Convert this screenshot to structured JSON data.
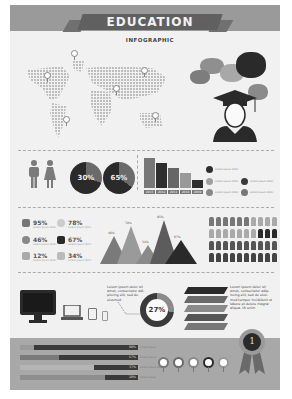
{
  "header": {
    "title": "EDUCATION",
    "subtitle": "INFOGRAPHIC"
  },
  "map_section": {
    "pins": 7,
    "graduate_icon": "graduate-cap-icon",
    "speech_bubbles": 5
  },
  "gender_section": {
    "icons": [
      "male-icon",
      "female-icon"
    ],
    "pies": [
      {
        "label": "30%",
        "value": 30
      },
      {
        "label": "65%",
        "value": 65
      }
    ]
  },
  "chart_data": [
    {
      "type": "bar",
      "title": "",
      "categories": [
        "2015",
        "2012",
        "2011",
        "2010",
        "2009"
      ],
      "values": [
        100,
        86,
        70,
        52,
        28
      ],
      "xlabel": "",
      "ylabel": "",
      "grid": false
    },
    {
      "type": "area",
      "title": "",
      "categories": [
        "A",
        "B",
        "C",
        "D",
        "E"
      ],
      "values": [
        46,
        78,
        34,
        95,
        67
      ],
      "labels": [
        "46%",
        "78%",
        "34%",
        "95%",
        "67%"
      ]
    },
    {
      "type": "pie",
      "title": "",
      "categories": [
        "highlight",
        "rest"
      ],
      "values": [
        27,
        73
      ],
      "labels": [
        "27%"
      ]
    },
    {
      "type": "bar",
      "orientation": "horizontal",
      "categories": [
        "row1",
        "row2",
        "row3",
        "row4"
      ],
      "values": [
        88,
        67,
        37,
        28
      ],
      "labels": [
        "88%",
        "67%",
        "37%",
        "28%"
      ]
    }
  ],
  "legend": {
    "items": [
      {
        "color": "#2e2e2e",
        "text": "Lorem ipsum dolor"
      },
      {
        "color": "#a0a0a0",
        "text": "Lorem ipsum dolor"
      },
      {
        "color": "#3a3a3a",
        "text": "Lorem ipsum dolor"
      },
      {
        "color": "#888888",
        "text": "Lorem ipsum dolor"
      },
      {
        "color": "#777777",
        "text": "Lorem ipsum dolor"
      }
    ]
  },
  "stats": [
    {
      "icon": "book-icon",
      "value": "95%",
      "sub": "Lorem ipsum dolor"
    },
    {
      "icon": "bulb-icon",
      "value": "78%",
      "sub": "Lorem ipsum dolor"
    },
    {
      "icon": "globe-icon",
      "value": "46%",
      "sub": "Lorem ipsum dolor"
    },
    {
      "icon": "chess-icon",
      "value": "67%",
      "sub": "Lorem ipsum dolor"
    },
    {
      "icon": "flask-icon",
      "value": "12%",
      "sub": "Lorem ipsum dolor"
    },
    {
      "icon": "trophy-icon",
      "value": "34%",
      "sub": "Lorem ipsum dolor"
    }
  ],
  "mountains": {
    "labels": [
      "46%",
      "78%",
      "34%",
      "95%",
      "67%"
    ]
  },
  "people_grid": {
    "rows": 4,
    "cols": 10
  },
  "devices": {
    "items": [
      "monitor-icon",
      "laptop-icon",
      "tablet-icon",
      "phone-icon"
    ],
    "note": "Lorem ipsum dolor sit amet, consectetur adi- piscing elit, sed do eiusmod",
    "donut_label": "27%"
  },
  "books": {
    "note": "Lorem ipsum dolor sit amet, consectetur adip- iscing elit, sed do eius- mod tempor incididunt ut labore et dolore magna aliqua. Ut enim"
  },
  "progress_bars": [
    {
      "value": "88%",
      "pct": 88,
      "label": "Lorem ipsum"
    },
    {
      "value": "67%",
      "pct": 67,
      "label": "Lorem ipsum"
    },
    {
      "value": "37%",
      "pct": 37,
      "label": "Lorem ipsum dolor"
    },
    {
      "value": "28%",
      "pct": 28,
      "label": "Lorem ipsum"
    }
  ],
  "rings": 5,
  "badge": {
    "label": "1"
  }
}
